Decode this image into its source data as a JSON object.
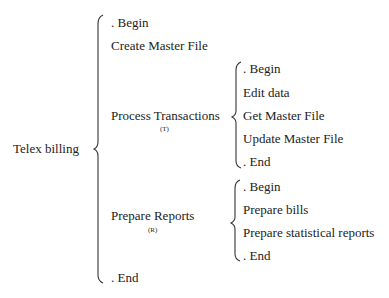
{
  "root": {
    "label": "Telex billing",
    "children": [
      {
        "label": ". Begin"
      },
      {
        "label": "Create Master File"
      },
      {
        "label": "Process Transactions",
        "annotation": "(T)",
        "children": [
          {
            "label": ". Begin"
          },
          {
            "label": "Edit data"
          },
          {
            "label": "Get Master File"
          },
          {
            "label": "Update Master File"
          },
          {
            "label": ". End"
          }
        ]
      },
      {
        "label": "Prepare Reports",
        "annotation": "(R)",
        "children": [
          {
            "label": ". Begin"
          },
          {
            "label": "Prepare bills"
          },
          {
            "label": "Prepare statistical reports"
          },
          {
            "label": ". End"
          }
        ]
      },
      {
        "label": ". End"
      }
    ]
  }
}
